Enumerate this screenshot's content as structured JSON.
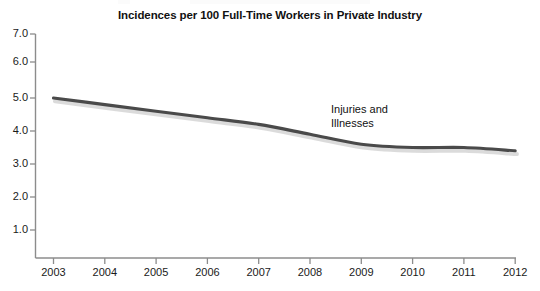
{
  "chart_data": {
    "type": "line",
    "title": "Incidences per 100 Full-Time Workers in Private Industry",
    "xlabel": "",
    "ylabel": "",
    "x": [
      2003,
      2004,
      2005,
      2006,
      2007,
      2008,
      2009,
      2010,
      2011,
      2012
    ],
    "categories": [
      "2003",
      "2004",
      "2005",
      "2006",
      "2007",
      "2008",
      "2009",
      "2010",
      "2011",
      "2012"
    ],
    "series": [
      {
        "name": "Injuries and Illnesses",
        "values": [
          5.0,
          4.8,
          4.6,
          4.4,
          4.2,
          3.9,
          3.6,
          3.5,
          3.5,
          3.4
        ],
        "color": "#4a4a4a"
      }
    ],
    "ylim": [
      0,
      7.0
    ],
    "yticks": [
      1.0,
      2.0,
      3.0,
      4.0,
      5.0,
      6.0,
      7.0
    ],
    "ytick_labels": [
      "1.0",
      "2.0",
      "3.0",
      "4.0",
      "5.0",
      "6.0",
      "7.0"
    ],
    "xlim": [
      2003,
      2012
    ],
    "xticks": [
      2003,
      2004,
      2005,
      2006,
      2007,
      2008,
      2009,
      2010,
      2011,
      2012
    ],
    "grid": false,
    "legend": "none",
    "annotations": [
      {
        "text": "Injuries and\nIllnesses",
        "x": 2008.6,
        "y": 4.85
      }
    ],
    "axis_color": "#8c8c8c",
    "text_color": "#1a1a1a",
    "background": "#ffffff"
  },
  "ticks": {
    "y": [
      "7.0",
      "6.0",
      "5.0",
      "4.0",
      "3.0",
      "2.0",
      "1.0"
    ],
    "x": [
      "2003",
      "2004",
      "2005",
      "2006",
      "2007",
      "2008",
      "2009",
      "2010",
      "2011",
      "2012"
    ]
  },
  "annotation": {
    "line1": "Injuries and",
    "line2": "Illnesses",
    "full": "Injuries and\nIllnesses"
  }
}
